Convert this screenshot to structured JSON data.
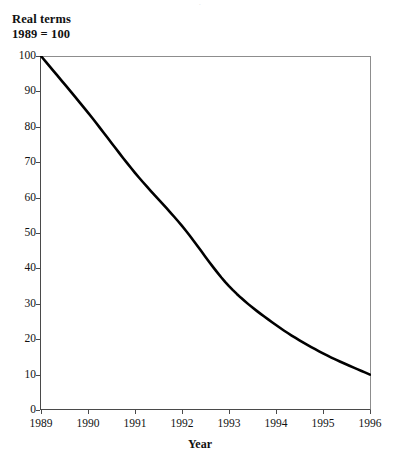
{
  "header": {
    "note_line1": "Real terms",
    "note_line2": "1989 = 100",
    "cropped_top_text": "·"
  },
  "chart_data": {
    "type": "line",
    "title": "",
    "subtitle": "Real terms, 1989 = 100",
    "xlabel": "Year",
    "ylabel": "",
    "categories": [
      "1989",
      "1990",
      "1991",
      "1992",
      "1993",
      "1994",
      "1995",
      "1996"
    ],
    "x": [
      1989,
      1990,
      1991,
      1992,
      1993,
      1994,
      1995,
      1996
    ],
    "values": [
      100,
      84,
      67,
      52,
      35,
      24,
      16,
      10
    ],
    "series": [
      {
        "name": "Real terms index",
        "values": [
          100,
          84,
          67,
          52,
          35,
          24,
          16,
          10
        ],
        "color": "#000000",
        "line_width": 2.6
      }
    ],
    "xlim": [
      1989,
      1996
    ],
    "ylim": [
      0,
      100
    ],
    "ytick_values": [
      0,
      10,
      20,
      30,
      40,
      50,
      60,
      70,
      80,
      90,
      100
    ],
    "ytick_labels": [
      "0",
      "10",
      "20",
      "30",
      "40",
      "50",
      "60",
      "70",
      "80",
      "90",
      "100"
    ],
    "xtick_labels": [
      "1989",
      "1990",
      "1991",
      "1992",
      "1993",
      "1994",
      "1995",
      "1996"
    ],
    "grid": false,
    "legend": false,
    "legend_position": "none"
  },
  "colors": {
    "line": "#000000",
    "axis": "#4a4a4a",
    "frame_light": "#8d8d8d",
    "background": "#ffffff",
    "text": "#111111"
  }
}
